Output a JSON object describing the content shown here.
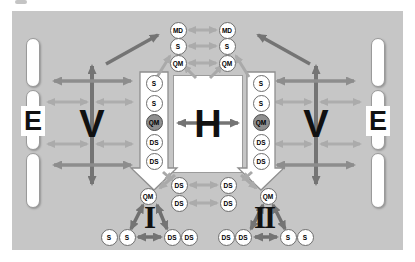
{
  "figure": {
    "letters": {
      "e_left": "E",
      "e_right": "E",
      "v_left": "V",
      "v_right": "V",
      "h": "H",
      "numeral_left": "I",
      "numeral_right": "II"
    },
    "nodes": {
      "top_left": [
        "MD",
        "S",
        "QM"
      ],
      "top_right": [
        "MD",
        "S",
        "QM"
      ],
      "left_arrow": [
        "S",
        "S",
        "QM",
        "DS",
        "DS"
      ],
      "right_arrow": [
        "S",
        "S",
        "QM",
        "DS",
        "DS"
      ],
      "mid_left": [
        "DS",
        "DS"
      ],
      "mid_right": [
        "DS",
        "DS"
      ],
      "qm_left": "QM",
      "qm_right": "QM",
      "bottom_left": [
        "S",
        "S",
        "DS",
        "DS"
      ],
      "bottom_right": [
        "DS",
        "DS",
        "S",
        "S"
      ]
    },
    "colors": {
      "panel_bg": "#c6c6c6",
      "node_fill": "#ffffff",
      "node_border": "#6e6e6e",
      "node_dark_fill": "#8f8f8f",
      "arrow_dark": "#747474",
      "arrow_mid": "#8d8d8d",
      "arrow_light": "#adadad",
      "white_arrow_outline": "#8f8f8f"
    }
  }
}
